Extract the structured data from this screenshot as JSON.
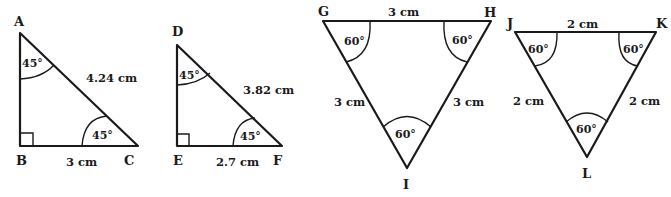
{
  "figure": {
    "triangles": [
      {
        "name": "ABC",
        "type": "right isosceles",
        "vertices": {
          "A": "A",
          "B": "B",
          "C": "C"
        },
        "sides": {
          "hypotenuse_AC": "4.24 cm",
          "base_BC": "3 cm"
        },
        "angles": {
          "A": "45°",
          "C": "45°",
          "B": "right angle"
        }
      },
      {
        "name": "DEF",
        "type": "right isosceles",
        "vertices": {
          "D": "D",
          "E": "E",
          "F": "F"
        },
        "sides": {
          "hypotenuse_DF": "3.82 cm",
          "base_EF": "2.7 cm"
        },
        "angles": {
          "D": "45°",
          "F": "45°",
          "E": "right angle"
        }
      },
      {
        "name": "GHI",
        "type": "equilateral",
        "vertices": {
          "G": "G",
          "H": "H",
          "I": "I"
        },
        "sides": {
          "GH": "3 cm",
          "GI": "3 cm",
          "HI": "3 cm"
        },
        "angles": {
          "G": "60°",
          "H": "60°",
          "I": "60°"
        }
      },
      {
        "name": "JKL",
        "type": "equilateral",
        "vertices": {
          "J": "J",
          "K": "K",
          "L": "L"
        },
        "sides": {
          "JK": "2 cm",
          "JL": "2 cm",
          "KL": "2 cm"
        },
        "angles": {
          "J": "60°",
          "K": "60°",
          "L": "60°"
        }
      }
    ]
  }
}
